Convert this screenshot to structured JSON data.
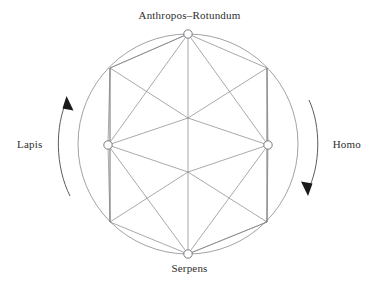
{
  "figure": {
    "title_label": "Anthropos–Rotundum",
    "bottom_label": "Serpens",
    "left_label": "Lapis",
    "right_label": "Homo"
  },
  "diagram": {
    "type": "node-link-circle",
    "background_color": "#ffffff",
    "line_color": "#7a7a80",
    "rim_color": "#8a8a90",
    "arrow_color": "#1a1a1a",
    "node_fill": "#ffffff",
    "text_color": "#2e2e2e",
    "circle": {
      "center_x": 188,
      "center_y": 144,
      "radius": 110
    },
    "cardinal_nodes": [
      {
        "id": "anthropos-rotundum",
        "label": "Anthropos–Rotundum",
        "x": 188,
        "y": 34,
        "position": "top",
        "marker_radius": 4.2
      },
      {
        "id": "homo",
        "label": "Homo",
        "x": 268,
        "y": 145,
        "position": "right",
        "marker_radius": 4.2
      },
      {
        "id": "serpens",
        "label": "Serpens",
        "x": 188,
        "y": 254,
        "position": "bottom",
        "marker_radius": 4.2
      },
      {
        "id": "lapis",
        "label": "Lapis",
        "x": 108,
        "y": 145,
        "position": "left",
        "marker_radius": 4.2
      }
    ],
    "rim_vertices": [
      {
        "id": "upper-left",
        "x": 110,
        "y": 68
      },
      {
        "id": "upper-right",
        "x": 267,
        "y": 68
      },
      {
        "id": "lower-left",
        "x": 110,
        "y": 222
      },
      {
        "id": "lower-right",
        "x": 267,
        "y": 222
      }
    ],
    "inner_vertices": [
      {
        "id": "upper-center",
        "x": 188,
        "y": 118
      },
      {
        "id": "lower-center",
        "x": 188,
        "y": 172
      }
    ],
    "rotation_arrows": [
      {
        "id": "left-arrow",
        "side": "left",
        "direction": "counterclockwise",
        "label": "Lapis"
      },
      {
        "id": "right-arrow",
        "side": "right",
        "direction": "clockwise",
        "label": "Homo"
      }
    ]
  }
}
